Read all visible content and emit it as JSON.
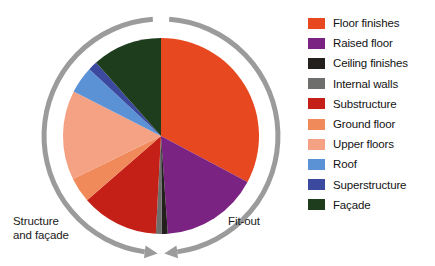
{
  "chart_data": {
    "type": "pie",
    "title": "",
    "subtitle": "",
    "xlabel": "",
    "ylabel": "",
    "legend_position": "right",
    "grid": false,
    "start_angle_deg": 0,
    "direction": "clockwise",
    "categories": [
      "Floor finishes",
      "Raised floor",
      "Ceiling finishes",
      "Internal walls",
      "Substructure",
      "Ground floor",
      "Upper floors",
      "Roof",
      "Superstructure",
      "Façade"
    ],
    "values": [
      33,
      16,
      1,
      1,
      13,
      4,
      15,
      4.5,
      1.5,
      11
    ],
    "colors": [
      "#E8481F",
      "#7B2382",
      "#231F1C",
      "#6E6E6C",
      "#C52018",
      "#F08A5B",
      "#F5A184",
      "#5B92D6",
      "#3B4A9E",
      "#1E3D1C"
    ],
    "slices": [
      {
        "label": "Floor finishes",
        "value": 33,
        "color": "#E8481F",
        "start_deg": 0,
        "end_deg": 118
      },
      {
        "label": "Raised floor",
        "value": 16,
        "color": "#7B2382",
        "start_deg": 118,
        "end_deg": 176
      },
      {
        "label": "Ceiling finishes",
        "value": 1,
        "color": "#231F1C",
        "start_deg": 176,
        "end_deg": 179.5
      },
      {
        "label": "Internal walls",
        "value": 1,
        "color": "#6E6E6C",
        "start_deg": 179.5,
        "end_deg": 183
      },
      {
        "label": "Substructure",
        "value": 13,
        "color": "#C52018",
        "start_deg": 183,
        "end_deg": 229
      },
      {
        "label": "Ground floor",
        "value": 4,
        "color": "#F08A5B",
        "start_deg": 229,
        "end_deg": 244
      },
      {
        "label": "Upper floors",
        "value": 15,
        "color": "#F5A184",
        "start_deg": 244,
        "end_deg": 297
      },
      {
        "label": "Roof",
        "value": 4.5,
        "color": "#5B92D6",
        "start_deg": 297,
        "end_deg": 313
      },
      {
        "label": "Superstructure",
        "value": 1.5,
        "color": "#3B4A9E",
        "start_deg": 313,
        "end_deg": 318.5
      },
      {
        "label": "Façade",
        "value": 11,
        "color": "#1E3D1C",
        "start_deg": 318.5,
        "end_deg": 360
      }
    ],
    "annotations": [
      {
        "name": "fit-out",
        "text": "Fit-out",
        "side": "right"
      },
      {
        "name": "structure-facade",
        "text": "Structure\nand façade",
        "side": "left"
      }
    ]
  },
  "legend": {
    "items": [
      {
        "label": "Floor finishes",
        "color": "#E8481F",
        "swatch_name": "legend-swatch-floor-finishes"
      },
      {
        "label": "Raised floor",
        "color": "#7B2382",
        "swatch_name": "legend-swatch-raised-floor"
      },
      {
        "label": "Ceiling finishes",
        "color": "#231F1C",
        "swatch_name": "legend-swatch-ceiling-finishes"
      },
      {
        "label": "Internal walls",
        "color": "#6E6E6C",
        "swatch_name": "legend-swatch-internal-walls"
      },
      {
        "label": "Substructure",
        "color": "#C52018",
        "swatch_name": "legend-swatch-substructure"
      },
      {
        "label": "Ground floor",
        "color": "#F08A5B",
        "swatch_name": "legend-swatch-ground-floor"
      },
      {
        "label": "Upper floors",
        "color": "#F5A184",
        "swatch_name": "legend-swatch-upper-floors"
      },
      {
        "label": "Roof",
        "color": "#5B92D6",
        "swatch_name": "legend-swatch-roof"
      },
      {
        "label": "Superstructure",
        "color": "#3B4A9E",
        "swatch_name": "legend-swatch-superstructure"
      },
      {
        "label": "Façade",
        "color": "#1E3D1C",
        "swatch_name": "legend-swatch-facade"
      }
    ]
  },
  "labels": {
    "left": "Structure\nand façade",
    "right": "Fit-out"
  },
  "rings": {
    "color": "#9B9B9B",
    "right_arc_name": "fit-out-arrow-arc",
    "left_arc_name": "structure-facade-arrow-arc"
  }
}
